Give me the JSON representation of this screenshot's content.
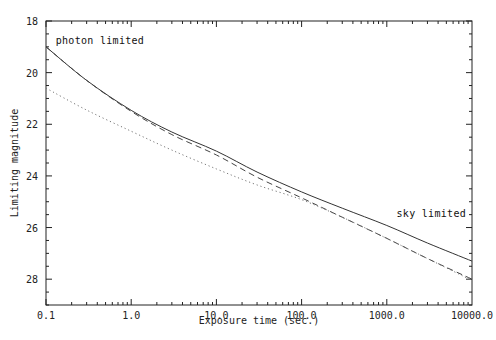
{
  "chart_data": {
    "type": "line",
    "title": "",
    "xlabel": "Exposure time (sec.)",
    "ylabel": "Limiting magnitude",
    "xscale": "log",
    "xlim": [
      0.1,
      10000
    ],
    "ylim": [
      29,
      18
    ],
    "y_inverted": true,
    "grid": false,
    "x_ticks": [
      0.1,
      1,
      10,
      100,
      1000,
      10000
    ],
    "x_tick_labels": [
      "0.1",
      "1.0",
      "10.0",
      "100.0",
      "1000.0",
      "10000.0"
    ],
    "y_ticks": [
      18,
      20,
      22,
      24,
      26,
      28
    ],
    "y_tick_labels": [
      "18",
      "20",
      "22",
      "24",
      "26",
      "28"
    ],
    "y_minor_step": 0.5,
    "x": [
      0.1,
      0.3,
      1,
      3,
      10,
      30,
      100,
      300,
      1000,
      3000,
      10000
    ],
    "series": [
      {
        "name": "solid",
        "style": "solid",
        "values": [
          19.0,
          20.3,
          21.46,
          22.3,
          23.04,
          23.85,
          24.62,
          25.25,
          25.92,
          26.6,
          27.3
        ]
      },
      {
        "name": "dashed",
        "style": "dashed",
        "values": [
          19.0,
          20.3,
          21.5,
          22.4,
          23.19,
          24.05,
          24.85,
          25.6,
          26.42,
          27.2,
          28.0
        ]
      },
      {
        "name": "dotted",
        "style": "dotted",
        "values": [
          20.6,
          21.45,
          22.27,
          23.0,
          23.73,
          24.35,
          24.92,
          25.6,
          26.42,
          27.2,
          28.05
        ]
      }
    ],
    "annotations": [
      {
        "text": "photon limited",
        "x": 0.13,
        "y": 18.9
      },
      {
        "text": "sky limited",
        "x": 1300,
        "y": 25.6
      }
    ]
  }
}
